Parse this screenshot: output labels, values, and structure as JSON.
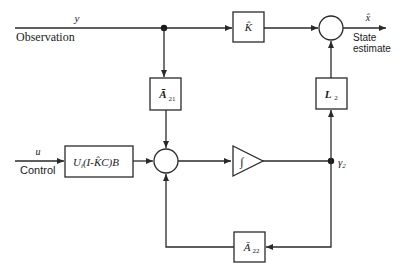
{
  "diagram": {
    "type": "block-diagram",
    "inputs": {
      "observation": {
        "symbol": "y",
        "label": "Observation"
      },
      "control": {
        "symbol": "u",
        "label": "Control"
      }
    },
    "output": {
      "symbol": "x̂",
      "label_line1": "State",
      "label_line2": "estimate"
    },
    "blocks": {
      "k_hat": {
        "label": "K̂"
      },
      "a21": {
        "main": "Ā",
        "sub": "21"
      },
      "l2": {
        "main": "L",
        "sub": "2"
      },
      "control_gain": {
        "label": "U",
        "sub": "i",
        "rest": "(I-K̂C)B"
      },
      "integrator": {
        "label": "∫"
      },
      "a22": {
        "main": "Ā",
        "sub": "22"
      }
    },
    "nodes": {
      "gamma2": {
        "main": "γ",
        "sub": "2"
      }
    },
    "colors": {
      "stroke": "#2a2a2a",
      "background": "#ffffff"
    }
  }
}
